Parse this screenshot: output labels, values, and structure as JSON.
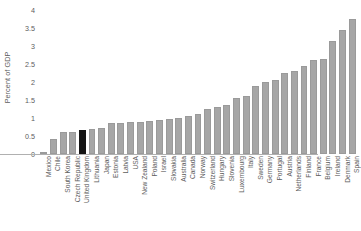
{
  "chart_data": {
    "type": "bar",
    "title": "",
    "xlabel": "",
    "ylabel": "Percent of GDP",
    "ylim": [
      0,
      4
    ],
    "yticks": [
      0,
      0.5,
      1,
      1.5,
      2,
      2.5,
      3,
      3.5,
      4
    ],
    "ytick_labels": [
      "0",
      "0.5",
      "1",
      "1.5",
      "2",
      "2.5",
      "3",
      "3.5",
      "4"
    ],
    "grid": false,
    "legend": null,
    "bar_color": "#a6a6a6",
    "highlight_color": "#141414",
    "highlight_category": "United Kingdom",
    "categories": [
      "Mexico",
      "Chile",
      "South Korea",
      "Czech Republic",
      "United Kingdom",
      "Lithuania",
      "Japan",
      "Estonia",
      "Latvia",
      "USA",
      "New Zealand",
      "Poland",
      "Israel",
      "Slovakia",
      "Australia",
      "Canada",
      "Norway",
      "Switzerland",
      "Hungary",
      "Slovenia",
      "Luxembourg",
      "Italy",
      "Sweden",
      "Germany",
      "Portugal",
      "Austria",
      "Netherlands",
      "Finland",
      "France",
      "Belgium",
      "Ireland",
      "Denmark",
      "Spain"
    ],
    "values": [
      0.05,
      0.42,
      0.6,
      0.62,
      0.68,
      0.7,
      0.72,
      0.85,
      0.87,
      0.88,
      0.9,
      0.92,
      0.95,
      0.97,
      1.0,
      1.05,
      1.1,
      1.25,
      1.3,
      1.35,
      1.55,
      1.62,
      1.9,
      2.0,
      2.05,
      2.25,
      2.3,
      2.45,
      2.6,
      2.65,
      3.15,
      3.45,
      3.75
    ]
  }
}
